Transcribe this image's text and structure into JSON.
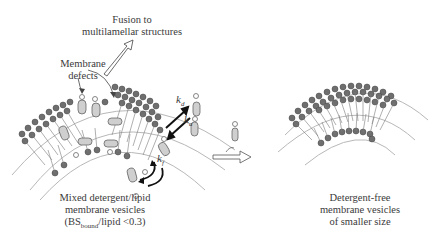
{
  "labels": {
    "fusion_line1": "Fusion to",
    "fusion_line2": "multilamellar structures",
    "defects_line1": "Membrane",
    "defects_line2": "defects",
    "mixed_line1": "Mixed detergent/lipid",
    "mixed_line2": "membrane vesicles",
    "mixed_line3_pre": "(BS",
    "mixed_line3_sub": "bound",
    "mixed_line3_post": "/lipid <0.3)",
    "free_line1": "Detergent-free",
    "free_line2": "membrane vesicles",
    "free_line3": "of smaller size"
  },
  "rates": {
    "kd_base": "k",
    "kd_sub": "d",
    "ka_base": "k",
    "ka_sub": "a",
    "kf_base": "k",
    "kf_sub": "f"
  },
  "colors": {
    "lipid_head": "#6e6e6e",
    "lipid_head_stroke": "#444444",
    "tail": "#7a7a7a",
    "arc": "#b5b5b5",
    "text": "#3a3a3a"
  }
}
